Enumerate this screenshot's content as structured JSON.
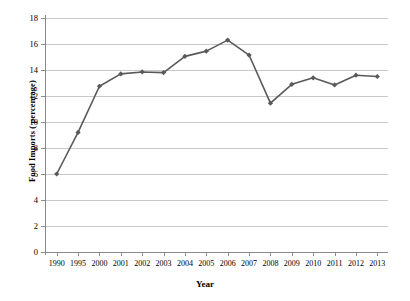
{
  "chart_data": {
    "type": "line",
    "title": "",
    "xlabel": "Year",
    "ylabel": "Food Imports ( percentage)",
    "categories": [
      "1990",
      "1995",
      "2000",
      "2001",
      "2002",
      "2003",
      "2004",
      "2005",
      "2006",
      "2007",
      "2008",
      "2009",
      "2010",
      "2011",
      "2012",
      "2013"
    ],
    "values": [
      6.0,
      9.2,
      12.75,
      13.7,
      13.85,
      13.8,
      15.05,
      15.45,
      16.3,
      15.15,
      11.45,
      12.9,
      13.4,
      12.85,
      13.6,
      13.5
    ],
    "series": [
      {
        "name": "Food Imports ( percentage)",
        "values": [
          6.0,
          9.2,
          12.75,
          13.7,
          13.85,
          13.8,
          15.05,
          15.45,
          16.3,
          15.15,
          11.45,
          12.9,
          13.4,
          12.85,
          13.6,
          13.5
        ]
      }
    ],
    "ylim": [
      0,
      18
    ],
    "ytick_labels": [
      "0",
      "2",
      "4",
      "6",
      "8",
      "10",
      "12",
      "14",
      "16",
      "18"
    ],
    "ytick_values": [
      0,
      2,
      4,
      6,
      8,
      10,
      12,
      14,
      16,
      18
    ],
    "grid": true,
    "grid_axis": "y",
    "legend": "none",
    "marker": "diamond",
    "colors": {
      "series_line": "#595959",
      "marker": "#595959",
      "gridline": "#c9c9c9",
      "axis": "#8a8a8a",
      "background": "#ffffff",
      "text": "#000000"
    }
  }
}
